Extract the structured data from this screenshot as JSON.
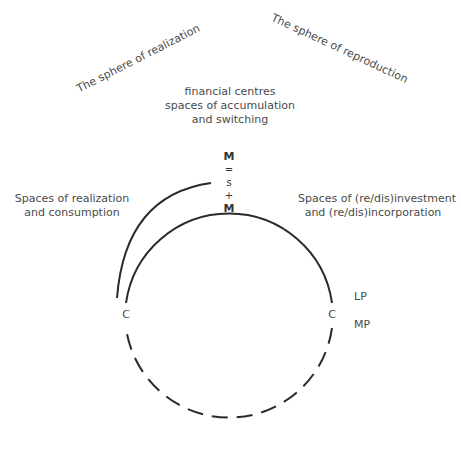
{
  "diagram": {
    "spheres": {
      "left": "The sphere of realization",
      "right": "The sphere of reproduction"
    },
    "centre_label": {
      "line1": "financial centres",
      "line2": "spaces of accumulation",
      "line3": "and switching"
    },
    "formula": {
      "top": "M",
      "eq": "=",
      "s": "s",
      "plus": "+",
      "bottom": "M"
    },
    "left_label": {
      "line1": "Spaces of realization",
      "line2": "and consumption"
    },
    "right_label": {
      "line1": "Spaces of (re/dis)investment",
      "line2": "and (re/dis)incorporation"
    },
    "nodes": {
      "left_c": "C",
      "right_c": "C",
      "lp": "LP",
      "mp": "MP"
    },
    "colors": {
      "line": "#2a2a2a",
      "text": "#4a4a4a"
    }
  }
}
